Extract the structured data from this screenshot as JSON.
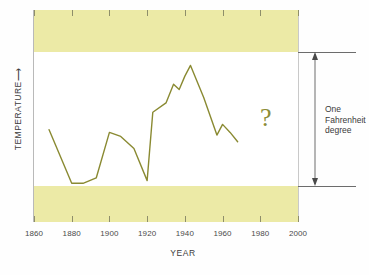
{
  "chart_data": {
    "type": "line",
    "title": "",
    "xlabel": "YEAR",
    "ylabel": "TEMPERATURE",
    "ylabel_arrow": "⟶",
    "xlim": [
      1860,
      2000
    ],
    "ylim_note": "Vertical span of white band equals one Fahrenheit degree",
    "xticks": [
      1860,
      1880,
      1900,
      1920,
      1940,
      1960,
      1980,
      2000
    ],
    "xtick_labels": [
      "1860",
      "1880",
      "1900",
      "1920",
      "1940",
      "1960",
      "1980",
      "2000"
    ],
    "grid": false,
    "legend": "none",
    "series": [
      {
        "name": "Global temperature",
        "color": "#8a8a32",
        "x": [
          1868,
          1880,
          1886,
          1893,
          1900,
          1906,
          1913,
          1920,
          1923,
          1930,
          1934,
          1937,
          1940,
          1943,
          1950,
          1957,
          1960,
          1964,
          1968
        ],
        "y": [
          0.42,
          0.02,
          0.02,
          0.06,
          0.4,
          0.37,
          0.28,
          0.04,
          0.55,
          0.62,
          0.76,
          0.72,
          0.82,
          0.9,
          0.66,
          0.38,
          0.46,
          0.4,
          0.33
        ]
      }
    ],
    "annotations": [
      {
        "name": "uncertainty-question-mark",
        "text": "?",
        "x": 1983,
        "y": 0.44,
        "color": "#8c8c36"
      },
      {
        "name": "scale-bar",
        "lines": [
          "One",
          "Fahrenheit",
          "degree"
        ],
        "style": "double-headed vertical arrow spanning the white band"
      }
    ],
    "bands": [
      {
        "name": "upper-shaded-band",
        "color": "#eceaa6"
      },
      {
        "name": "lower-shaded-band",
        "color": "#eceaa6"
      }
    ]
  },
  "axis": {
    "x_title": "YEAR",
    "y_title": "TEMPERATURE",
    "y_arrow": "⟶"
  },
  "scale_annotation": {
    "line1": "One",
    "line2": "Fahrenheit",
    "line3": "degree"
  },
  "marks": {
    "question": "?"
  }
}
